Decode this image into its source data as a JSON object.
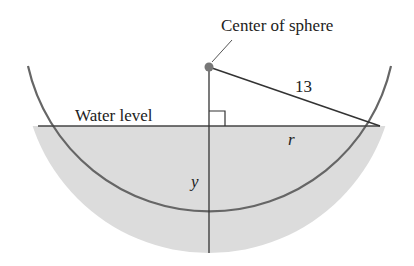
{
  "diagram": {
    "title_label": "Center of sphere",
    "water_label": "Water level",
    "hypotenuse_label": "13",
    "radius_label": "r",
    "depth_label": "y",
    "colors": {
      "water_fill": "#dcdcdc",
      "bowl_stroke": "#666666",
      "line_stroke": "#333333",
      "center_dot": "#777777"
    }
  }
}
